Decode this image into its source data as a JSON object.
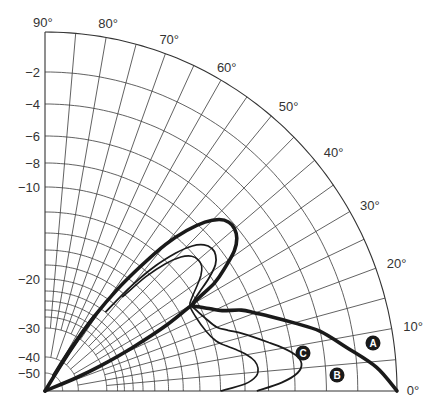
{
  "chart_data": {
    "type": "polar-line",
    "title": "",
    "angular_axis": {
      "range_deg": [
        0,
        90
      ],
      "tick_step_deg": 5,
      "tick_labels": [
        "0°",
        "10°",
        "20°",
        "30°",
        "40°",
        "50°",
        "60°",
        "70°",
        "80°",
        "90°"
      ]
    },
    "radial_axis": {
      "unit": "dB",
      "range": [
        -50,
        0
      ],
      "rings_db": [
        0,
        -2,
        -4,
        -6,
        -8,
        -10,
        -12,
        -14,
        -16,
        -18,
        -20,
        -22,
        -24,
        -26,
        -28,
        -30,
        -40,
        -50
      ],
      "tick_labels": [
        "−2",
        "−4",
        "−6",
        "−8",
        "−10",
        "−20",
        "−30",
        "−40",
        "−50"
      ],
      "labeled_rings_db": [
        -2,
        -4,
        -6,
        -8,
        -10,
        -20,
        -30,
        -40,
        -50
      ]
    },
    "series": [
      {
        "name": "A",
        "style": "thick",
        "points_deg_db": [
          [
            0,
            0
          ],
          [
            4,
            -1
          ],
          [
            8,
            -2.5
          ],
          [
            12,
            -4
          ],
          [
            15,
            -5.5
          ],
          [
            18,
            -7
          ],
          [
            20,
            -8
          ],
          [
            22,
            -9
          ],
          [
            24,
            -10.5
          ],
          [
            26,
            -11.3
          ],
          [
            28,
            -12
          ],
          [
            30,
            -12.4
          ],
          [
            32,
            -10
          ],
          [
            34,
            -8.5
          ],
          [
            36,
            -7.2
          ],
          [
            38,
            -6.5
          ],
          [
            40,
            -6.2
          ],
          [
            42,
            -6.2
          ],
          [
            44,
            -6.6
          ],
          [
            46,
            -7.5
          ],
          [
            48,
            -9
          ],
          [
            50,
            -11
          ],
          [
            52,
            -14
          ],
          [
            54,
            -18
          ],
          [
            56,
            -24
          ],
          [
            58,
            -34
          ],
          [
            60,
            -50
          ]
        ],
        "lower_null": [
          [
            22,
            -50
          ],
          [
            24,
            -40
          ],
          [
            26,
            -30
          ],
          [
            28,
            -20
          ],
          [
            29,
            -14
          ],
          [
            30,
            -12.4
          ]
        ]
      },
      {
        "name": "B",
        "style": "medium",
        "points_deg_db": [
          [
            0,
            -9
          ],
          [
            2,
            -7
          ],
          [
            4,
            -5.8
          ],
          [
            6,
            -5.5
          ],
          [
            8,
            -5.8
          ],
          [
            10,
            -6.6
          ],
          [
            12,
            -7.6
          ],
          [
            14,
            -8.6
          ],
          [
            16,
            -9.6
          ],
          [
            18,
            -10.6
          ],
          [
            20,
            -11.4
          ],
          [
            24,
            -12
          ],
          [
            28,
            -12.5
          ],
          [
            30,
            -12.6
          ],
          [
            32,
            -11.5
          ],
          [
            34,
            -10.2
          ],
          [
            36,
            -9.1
          ],
          [
            38,
            -8.6
          ],
          [
            40,
            -8.5
          ],
          [
            42,
            -8.8
          ],
          [
            44,
            -9.6
          ],
          [
            46,
            -11
          ],
          [
            48,
            -13
          ],
          [
            50,
            -16.5
          ],
          [
            52,
            -22
          ]
        ]
      },
      {
        "name": "C",
        "style": "thin",
        "points_deg_db": [
          [
            0,
            -12
          ],
          [
            2,
            -10
          ],
          [
            4,
            -9
          ],
          [
            6,
            -8.8
          ],
          [
            8,
            -9
          ],
          [
            10,
            -9.6
          ],
          [
            12,
            -10.4
          ],
          [
            14,
            -11.2
          ],
          [
            16,
            -11.8
          ],
          [
            20,
            -12.4
          ],
          [
            26,
            -12.8
          ],
          [
            30,
            -12.8
          ],
          [
            32,
            -12.2
          ],
          [
            34,
            -11.4
          ],
          [
            36,
            -10.6
          ],
          [
            38,
            -10.1
          ],
          [
            40,
            -10
          ],
          [
            42,
            -10.2
          ],
          [
            44,
            -10.9
          ],
          [
            46,
            -12.2
          ],
          [
            48,
            -14.5
          ],
          [
            50,
            -18.5
          ]
        ]
      }
    ],
    "annotations": [
      {
        "text": "A",
        "style": "white on black circle"
      },
      {
        "text": "B",
        "style": "white on black circle"
      },
      {
        "text": "C",
        "style": "white on black circle"
      }
    ],
    "legend": "none (inline circular labels)",
    "grid": true
  },
  "labels": {
    "angles": [
      {
        "text": "90°",
        "deg": 90
      },
      {
        "text": "80°",
        "deg": 80
      },
      {
        "text": "70°",
        "deg": 70
      },
      {
        "text": "60°",
        "deg": 60
      },
      {
        "text": "50°",
        "deg": 50
      },
      {
        "text": "40°",
        "deg": 40
      },
      {
        "text": "30°",
        "deg": 30
      },
      {
        "text": "20°",
        "deg": 20
      },
      {
        "text": "10°",
        "deg": 10
      },
      {
        "text": "0°",
        "deg": 0
      }
    ],
    "db": [
      {
        "text": "−2",
        "db": -2
      },
      {
        "text": "−4",
        "db": -4
      },
      {
        "text": "−6",
        "db": -6
      },
      {
        "text": "−8",
        "db": -8
      },
      {
        "text": "−10",
        "db": -10
      },
      {
        "text": "−20",
        "db": -20
      },
      {
        "text": "−30",
        "db": -30
      },
      {
        "text": "−40",
        "db": -40
      },
      {
        "text": "−50",
        "db": -50
      }
    ],
    "badges": [
      {
        "text": "A",
        "x": 373,
        "y": 343
      },
      {
        "text": "B",
        "x": 337,
        "y": 375
      },
      {
        "text": "C",
        "x": 303,
        "y": 353
      }
    ]
  }
}
